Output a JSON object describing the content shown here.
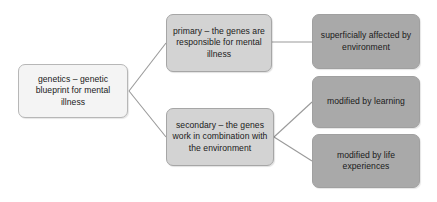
{
  "diagram": {
    "type": "tree-flowchart",
    "orientation": "left-to-right",
    "colors": {
      "background": "#ffffff",
      "root_fill": "#f4f4f4",
      "mid_fill": "#d3d3d3",
      "leaf_fill": "#a9a9a9",
      "border": "#a6a6a6",
      "connector": "#9a9a9a",
      "text": "#1a1a1a"
    },
    "nodes": {
      "root": {
        "id": "root",
        "label": "genetics – genetic blueprint for mental illness",
        "level": 0
      },
      "branches": [
        {
          "id": "primary",
          "label": "primary – the genes are responsible for mental illness",
          "level": 1
        },
        {
          "id": "secondary",
          "label": "secondary – the genes work in combination with the environment",
          "level": 1
        }
      ],
      "leaves": [
        {
          "id": "superficially-affected",
          "label": "superficially affected by environment",
          "level": 2,
          "parent": "primary"
        },
        {
          "id": "modified-by-learning",
          "label": "modified by learning",
          "level": 2,
          "parent": "secondary"
        },
        {
          "id": "modified-by-life-experiences",
          "label": "modified by life experiences",
          "level": 2,
          "parent": "secondary"
        }
      ]
    },
    "connectors": [
      {
        "from": "root",
        "to": "primary",
        "style": "straight-line"
      },
      {
        "from": "root",
        "to": "secondary",
        "style": "straight-line"
      },
      {
        "from": "primary",
        "to": "superficially-affected",
        "style": "straight-line"
      },
      {
        "from": "secondary",
        "to": "modified-by-learning",
        "style": "straight-line"
      },
      {
        "from": "secondary",
        "to": "modified-by-life-experiences",
        "style": "straight-line"
      }
    ]
  }
}
